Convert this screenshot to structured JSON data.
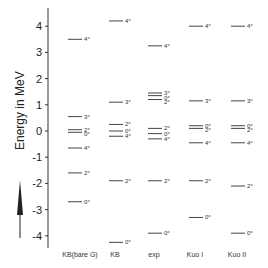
{
  "chart_data": {
    "type": "level-scheme",
    "ylabel": "Energy in MeV",
    "ylim": [
      -4.6,
      4.6
    ],
    "yticks": [
      4,
      3,
      2,
      1,
      0,
      -1,
      -2,
      -3,
      -4
    ],
    "ytick_labels": [
      "4",
      "3",
      "2",
      "1",
      "0",
      "-1",
      "-2",
      "-3",
      "-4"
    ],
    "columns": [
      {
        "name": "KB(bare G)",
        "levels": [
          {
            "energy": 3.5,
            "label": "4+"
          },
          {
            "energy": 0.55,
            "label": "3+"
          },
          {
            "energy": 0.05,
            "label": "2+"
          },
          {
            "energy": -0.05,
            "label": "0+"
          },
          {
            "energy": -0.65,
            "label": "4+"
          },
          {
            "energy": -1.6,
            "label": "2+"
          },
          {
            "energy": -2.7,
            "label": "0+"
          }
        ]
      },
      {
        "name": "KB",
        "levels": [
          {
            "energy": 4.2,
            "label": "4+"
          },
          {
            "energy": 1.1,
            "label": "3+"
          },
          {
            "energy": 0.25,
            "label": "2+"
          },
          {
            "energy": 0.0,
            "label": "0+"
          },
          {
            "energy": -0.2,
            "label": "4+"
          },
          {
            "energy": -1.9,
            "label": "2+"
          },
          {
            "energy": -4.25,
            "label": "0+"
          }
        ]
      },
      {
        "name": "exp",
        "levels": [
          {
            "energy": 3.25,
            "label": "4+"
          },
          {
            "energy": 1.45,
            "label": "3+"
          },
          {
            "energy": 1.35,
            "label": "0+"
          },
          {
            "energy": 1.2,
            "label": "2+"
          },
          {
            "energy": 0.1,
            "label": "2+"
          },
          {
            "energy": -0.1,
            "label": "0+"
          },
          {
            "energy": -0.3,
            "label": "4+"
          },
          {
            "energy": -1.9,
            "label": "2+"
          },
          {
            "energy": -3.9,
            "label": "0+"
          }
        ]
      },
      {
        "name": "Kuo I",
        "levels": [
          {
            "energy": 4.0,
            "label": "4+"
          },
          {
            "energy": 1.15,
            "label": "3+"
          },
          {
            "energy": 0.2,
            "label": "0+"
          },
          {
            "energy": 0.1,
            "label": "2+"
          },
          {
            "energy": -0.45,
            "label": "4+"
          },
          {
            "energy": -1.9,
            "label": "2+"
          },
          {
            "energy": -3.3,
            "label": "0+"
          }
        ]
      },
      {
        "name": "Kuo II",
        "levels": [
          {
            "energy": 4.0,
            "label": "4+"
          },
          {
            "energy": 1.15,
            "label": "3+"
          },
          {
            "energy": 0.2,
            "label": "0+"
          },
          {
            "energy": 0.1,
            "label": "2+"
          },
          {
            "energy": -0.45,
            "label": "4+"
          },
          {
            "energy": -2.1,
            "label": "2+"
          },
          {
            "energy": -3.9,
            "label": "0+"
          }
        ]
      }
    ]
  }
}
